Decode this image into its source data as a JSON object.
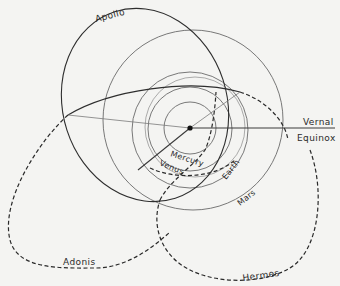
{
  "diagram": {
    "title": "",
    "center": {
      "name": "Sun",
      "x": 190,
      "y": 128
    },
    "reference": {
      "label_line1": "Vernal",
      "label_line2": "Equinox"
    },
    "planets": [
      {
        "name": "Mercury",
        "label": "Mercury"
      },
      {
        "name": "Venus",
        "label": "Venus"
      },
      {
        "name": "Earth",
        "label": "Earth"
      },
      {
        "name": "Mars",
        "label": "Mars"
      }
    ],
    "asteroids": [
      {
        "name": "Apollo",
        "label": "Apollo",
        "style": "solid"
      },
      {
        "name": "Adonis",
        "label": "Adonis",
        "style": "dashed"
      },
      {
        "name": "Hermes",
        "label": "Hermes",
        "style": "dashed"
      }
    ],
    "colors": {
      "background": "#f4f4f2",
      "planet_orbit": "#6a6a6a",
      "asteroid_orbit": "#2a2a2a"
    }
  }
}
